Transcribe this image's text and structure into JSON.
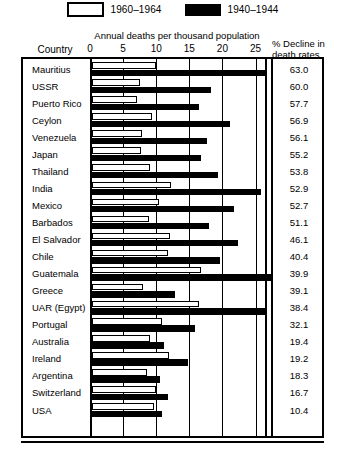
{
  "legend": {
    "items": [
      {
        "key": "white",
        "label": "1960–1964",
        "swatch": "white-rect-icon"
      },
      {
        "key": "black",
        "label": "1940–1944",
        "swatch": "black-rect-icon"
      }
    ]
  },
  "headers": {
    "country": "Country",
    "axis_title": "Annual deaths per thousand population",
    "decline_line1": "% Decline in",
    "decline_line2": "death rates"
  },
  "chart_data": {
    "type": "bar",
    "orientation": "horizontal",
    "title": "Annual deaths per thousand population",
    "xlabel": "Annual deaths per thousand population",
    "ylabel": "Country",
    "xlim": [
      0,
      26.5
    ],
    "xticks": [
      0,
      5,
      10,
      15,
      20,
      25
    ],
    "grid": true,
    "legend_position": "top-center",
    "categories": [
      "Mauritius",
      "USSR",
      "Puerto Rico",
      "Ceylon",
      "Venezuela",
      "Japan",
      "Thailand",
      "India",
      "Mexico",
      "Barbados",
      "El Salvador",
      "Chile",
      "Guatemala",
      "Greece",
      "UAR (Egypt)",
      "Portugal",
      "Australia",
      "Ireland",
      "Argentina",
      "Switzerland",
      "USA"
    ],
    "series": [
      {
        "name": "1960–1964",
        "color": "#ffffff",
        "values": [
          9.7,
          7.2,
          6.8,
          9.0,
          7.6,
          7.4,
          8.8,
          12.0,
          10.1,
          8.6,
          11.8,
          11.5,
          16.5,
          7.7,
          16.1,
          10.5,
          8.8,
          11.7,
          8.3,
          9.6,
          9.4
        ]
      },
      {
        "name": "1940–1944",
        "color": "#000000",
        "values": [
          26.2,
          18.0,
          16.1,
          20.9,
          17.3,
          16.5,
          19.1,
          25.5,
          21.4,
          17.6,
          22.0,
          19.3,
          27.4,
          12.6,
          26.1,
          15.5,
          10.9,
          14.5,
          10.2,
          11.5,
          10.5
        ]
      }
    ],
    "decline_label": "% Decline in death rates",
    "decline_values": [
      63.0,
      60.0,
      57.7,
      56.9,
      56.1,
      55.2,
      53.8,
      52.9,
      52.7,
      51.1,
      46.1,
      40.4,
      39.9,
      39.1,
      38.4,
      32.1,
      19.4,
      19.2,
      18.3,
      16.7,
      10.4
    ]
  }
}
